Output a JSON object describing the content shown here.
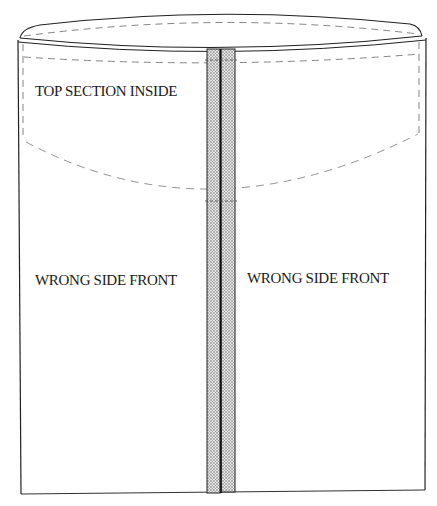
{
  "diagram": {
    "type": "sewing-construction-illustration",
    "labels": {
      "top_section": "TOP SECTION INSIDE",
      "left_panel": "WRONG SIDE FRONT",
      "right_panel": "WRONG SIDE FRONT"
    },
    "colors": {
      "line": "#222222",
      "dashed": "#777777",
      "seam_fill": "#d8d8d8",
      "background": "#ffffff"
    }
  }
}
